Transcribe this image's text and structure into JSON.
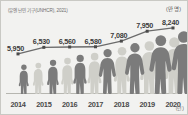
{
  "caption": {
    "source": "(유엔 난민 기구(UNHCR), 2021)",
    "unit": "(만 명)",
    "axis_unit": "(년)"
  },
  "colors": {
    "background": "#f2f2f0",
    "border": "#c9c9c4",
    "line": "#6b6b6b",
    "marker": "#4a4a4a",
    "figure_dark": "#7b7b7b",
    "figure_light": "#cfcfc9",
    "label_text": "#3a3a3a",
    "tick_text": "#4a4a4a"
  },
  "chart_data": {
    "type": "line",
    "title": "",
    "xlabel": "(년)",
    "ylabel": "(만 명)",
    "grid": false,
    "legend": "none",
    "categories": [
      "2014",
      "2015",
      "2016",
      "2017",
      "2018",
      "2019",
      "2020"
    ],
    "values": [
      5950,
      6530,
      6560,
      6580,
      7080,
      7950,
      8240
    ],
    "value_labels": [
      "5,950",
      "6,530",
      "6,560",
      "6,580",
      "7,080",
      "7,950",
      "8,240"
    ],
    "ylim": [
      5500,
      8500
    ]
  },
  "figures": [
    {
      "year": "2014",
      "tone": "dark"
    },
    {
      "year": "2014b",
      "tone": "light"
    },
    {
      "year": "2015",
      "tone": "dark"
    },
    {
      "year": "2015b",
      "tone": "light"
    },
    {
      "year": "2016",
      "tone": "dark"
    },
    {
      "year": "2016b",
      "tone": "light"
    },
    {
      "year": "2017",
      "tone": "dark"
    },
    {
      "year": "2017b",
      "tone": "light"
    },
    {
      "year": "2018",
      "tone": "dark"
    },
    {
      "year": "2018b",
      "tone": "light"
    },
    {
      "year": "2019",
      "tone": "dark"
    },
    {
      "year": "2019b",
      "tone": "light"
    },
    {
      "year": "2020",
      "tone": "dark"
    }
  ]
}
